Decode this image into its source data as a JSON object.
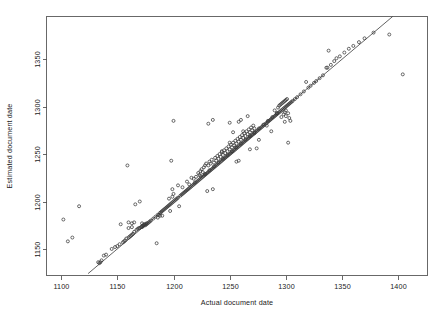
{
  "figure": {
    "background_color": "#ffffff",
    "point_color": "#383838",
    "line_color": "#3a3a3a",
    "axis_color": "#4d4d4d"
  },
  "chart_data": {
    "type": "scatter",
    "title": "",
    "xlabel": "Actual document date",
    "ylabel": "Estimated document date",
    "xlim": [
      1087,
      1426
    ],
    "ylim": [
      1122,
      1395
    ],
    "xticks": [
      1100,
      1150,
      1200,
      1250,
      1300,
      1350,
      1400
    ],
    "xtick_labels": [
      "1100",
      "1150",
      "1200",
      "1250",
      "1300",
      "1350",
      "1400"
    ],
    "yticks": [
      1150,
      1200,
      1250,
      1300,
      1350
    ],
    "ytick_labels": [
      "1150",
      "1200",
      "1250",
      "1300",
      "1350"
    ],
    "grid": false,
    "legend": null,
    "marker": "open-circle",
    "marker_size": 3,
    "reference_line": {
      "description": "y = x identity line",
      "slope": 1,
      "intercept": 0,
      "x_start": 1124,
      "x_end": 1400
    },
    "x": [
      1102,
      1106,
      1110,
      1116,
      1133,
      1134,
      1135,
      1136,
      1138,
      1140,
      1145,
      1148,
      1150,
      1152,
      1153,
      1155,
      1156,
      1157,
      1158,
      1159,
      1160,
      1160,
      1161,
      1162,
      1163,
      1163,
      1164,
      1165,
      1166,
      1167,
      1168,
      1169,
      1170,
      1170,
      1171,
      1172,
      1172,
      1173,
      1173,
      1174,
      1174,
      1175,
      1175,
      1176,
      1176,
      1177,
      1178,
      1179,
      1180,
      1182,
      1184,
      1185,
      1186,
      1187,
      1188,
      1189,
      1190,
      1190,
      1191,
      1192,
      1193,
      1194,
      1195,
      1196,
      1197,
      1197,
      1198,
      1198,
      1199,
      1199,
      1200,
      1200,
      1201,
      1202,
      1203,
      1204,
      1205,
      1206,
      1207,
      1208,
      1209,
      1210,
      1211,
      1212,
      1213,
      1214,
      1215,
      1216,
      1216,
      1217,
      1218,
      1218,
      1219,
      1220,
      1220,
      1221,
      1222,
      1222,
      1223,
      1223,
      1224,
      1224,
      1225,
      1225,
      1226,
      1226,
      1227,
      1227,
      1228,
      1228,
      1229,
      1229,
      1230,
      1230,
      1231,
      1231,
      1232,
      1232,
      1233,
      1233,
      1234,
      1234,
      1235,
      1235,
      1236,
      1236,
      1237,
      1237,
      1238,
      1238,
      1239,
      1239,
      1240,
      1240,
      1241,
      1241,
      1242,
      1242,
      1243,
      1243,
      1244,
      1244,
      1245,
      1245,
      1246,
      1246,
      1247,
      1247,
      1248,
      1248,
      1249,
      1249,
      1250,
      1250,
      1250,
      1251,
      1251,
      1252,
      1252,
      1253,
      1253,
      1254,
      1254,
      1255,
      1255,
      1256,
      1256,
      1257,
      1257,
      1258,
      1258,
      1259,
      1259,
      1260,
      1260,
      1261,
      1261,
      1262,
      1262,
      1263,
      1263,
      1264,
      1264,
      1265,
      1265,
      1266,
      1266,
      1267,
      1267,
      1268,
      1268,
      1269,
      1269,
      1270,
      1270,
      1271,
      1271,
      1272,
      1272,
      1273,
      1274,
      1275,
      1276,
      1277,
      1278,
      1279,
      1280,
      1281,
      1282,
      1283,
      1284,
      1285,
      1286,
      1287,
      1288,
      1289,
      1290,
      1290,
      1291,
      1292,
      1293,
      1293,
      1294,
      1294,
      1295,
      1295,
      1296,
      1296,
      1297,
      1297,
      1298,
      1298,
      1298,
      1299,
      1299,
      1299,
      1300,
      1300,
      1300,
      1300,
      1301,
      1301,
      1302,
      1302,
      1303,
      1303,
      1304,
      1305,
      1306,
      1308,
      1310,
      1313,
      1316,
      1318,
      1320,
      1322,
      1325,
      1327,
      1330,
      1333,
      1336,
      1337,
      1338,
      1340,
      1343,
      1345,
      1348,
      1352,
      1356,
      1360,
      1365,
      1370,
      1378,
      1392,
      1404,
      1186,
      1196,
      1200,
      1214,
      1231,
      1235,
      1243,
      1250,
      1253,
      1255,
      1256,
      1258,
      1258,
      1260,
      1262,
      1266,
      1268,
      1272,
      1274,
      1276,
      1283,
      1287,
      1292,
      1296,
      1299,
      1302,
      1304,
      1160,
      1163,
      1165,
      1172,
      1188,
      1199,
      1204,
      1208,
      1212,
      1219,
      1224,
      1228,
      1232,
      1236,
      1240,
      1244,
      1248,
      1252,
      1256,
      1260,
      1264,
      1268,
      1272,
      1276,
      1280,
      1284,
      1288,
      1292
    ],
    "y": [
      1181,
      1158,
      1162,
      1195,
      1136,
      1135,
      1136,
      1138,
      1143,
      1144,
      1150,
      1152,
      1153,
      1155,
      1176,
      1157,
      1158,
      1159,
      1161,
      1238,
      1162,
      1172,
      1163,
      1164,
      1165,
      1173,
      1166,
      1168,
      1197,
      1170,
      1171,
      1172,
      1172,
      1200,
      1173,
      1173,
      1174,
      1174,
      1175,
      1175,
      1176,
      1175,
      1176,
      1176,
      1177,
      1177,
      1178,
      1179,
      1180,
      1182,
      1184,
      1156,
      1186,
      1186,
      1188,
      1189,
      1185,
      1190,
      1191,
      1192,
      1193,
      1194,
      1195,
      1196,
      1190,
      1197,
      1198,
      1243,
      1199,
      1205,
      1200,
      1208,
      1201,
      1202,
      1203,
      1204,
      1195,
      1206,
      1207,
      1208,
      1209,
      1210,
      1211,
      1212,
      1213,
      1214,
      1215,
      1216,
      1225,
      1217,
      1218,
      1224,
      1219,
      1220,
      1226,
      1221,
      1222,
      1230,
      1223,
      1228,
      1224,
      1232,
      1225,
      1234,
      1226,
      1231,
      1227,
      1236,
      1228,
      1238,
      1229,
      1240,
      1230,
      1211,
      1231,
      1238,
      1232,
      1242,
      1233,
      1240,
      1234,
      1244,
      1235,
      1213,
      1236,
      1241,
      1237,
      1246,
      1238,
      1243,
      1239,
      1248,
      1240,
      1245,
      1241,
      1250,
      1242,
      1247,
      1243,
      1252,
      1244,
      1249,
      1245,
      1254,
      1246,
      1251,
      1247,
      1256,
      1248,
      1253,
      1249,
      1258,
      1250,
      1255,
      1262,
      1251,
      1260,
      1252,
      1257,
      1253,
      1262,
      1254,
      1259,
      1255,
      1264,
      1256,
      1261,
      1257,
      1266,
      1258,
      1263,
      1259,
      1268,
      1260,
      1265,
      1261,
      1270,
      1262,
      1267,
      1263,
      1272,
      1264,
      1269,
      1265,
      1274,
      1266,
      1271,
      1267,
      1276,
      1268,
      1273,
      1269,
      1278,
      1270,
      1275,
      1271,
      1280,
      1272,
      1277,
      1273,
      1274,
      1275,
      1276,
      1277,
      1278,
      1279,
      1280,
      1281,
      1282,
      1283,
      1284,
      1285,
      1286,
      1287,
      1288,
      1289,
      1290,
      1296,
      1291,
      1292,
      1293,
      1299,
      1294,
      1301,
      1295,
      1302,
      1296,
      1303,
      1297,
      1304,
      1298,
      1292,
      1305,
      1299,
      1294,
      1306,
      1300,
      1290,
      1296,
      1307,
      1301,
      1308,
      1302,
      1293,
      1303,
      1288,
      1304,
      1305,
      1306,
      1308,
      1310,
      1313,
      1316,
      1326,
      1320,
      1322,
      1325,
      1327,
      1330,
      1333,
      1341,
      1341,
      1359,
      1344,
      1348,
      1351,
      1353,
      1357,
      1361,
      1364,
      1368,
      1372,
      1378,
      1376,
      1334,
      1183,
      1203,
      1285,
      1218,
      1282,
      1286,
      1253,
      1283,
      1273,
      1257,
      1242,
      1243,
      1284,
      1286,
      1274,
      1290,
      1255,
      1272,
      1256,
      1265,
      1280,
      1274,
      1293,
      1289,
      1284,
      1262,
      1285,
      1178,
      1177,
      1178,
      1177,
      1185,
      1213,
      1217,
      1215,
      1221,
      1220,
      1227,
      1229,
      1233,
      1237,
      1241,
      1245,
      1249,
      1253,
      1257,
      1261,
      1265,
      1269,
      1273,
      1277,
      1281,
      1285,
      1289,
      1293
    ]
  }
}
